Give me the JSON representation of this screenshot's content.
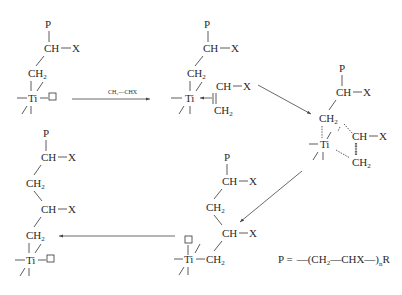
{
  "labels": {
    "P": "P",
    "CH": "CH",
    "X": "X",
    "CH2": "CH",
    "sub2": "2",
    "Ti": "Ti",
    "dash": "—",
    "reagent": "CH₂—CHX",
    "legend_lhs": "P =",
    "legend_open": "—(",
    "legend_ch2": "CH",
    "legend_sub2": "2",
    "legend_bond": "—CHX",
    "legend_close": "—)",
    "legend_n": "n",
    "legend_R": "R"
  },
  "structures": [
    {
      "name": "active-center",
      "position": "top-left"
    },
    {
      "name": "pi-complex",
      "position": "top-middle"
    },
    {
      "name": "transition-state",
      "position": "right"
    },
    {
      "name": "insertion-product",
      "position": "bottom-middle"
    },
    {
      "name": "regenerated-center",
      "position": "bottom-left"
    }
  ],
  "arrows": [
    {
      "from": "active-center",
      "to": "pi-complex",
      "label": "CH₂—CHX"
    },
    {
      "from": "pi-complex",
      "to": "transition-state",
      "label": ""
    },
    {
      "from": "transition-state",
      "to": "insertion-product",
      "label": ""
    },
    {
      "from": "insertion-product",
      "to": "regenerated-center",
      "label": ""
    }
  ]
}
